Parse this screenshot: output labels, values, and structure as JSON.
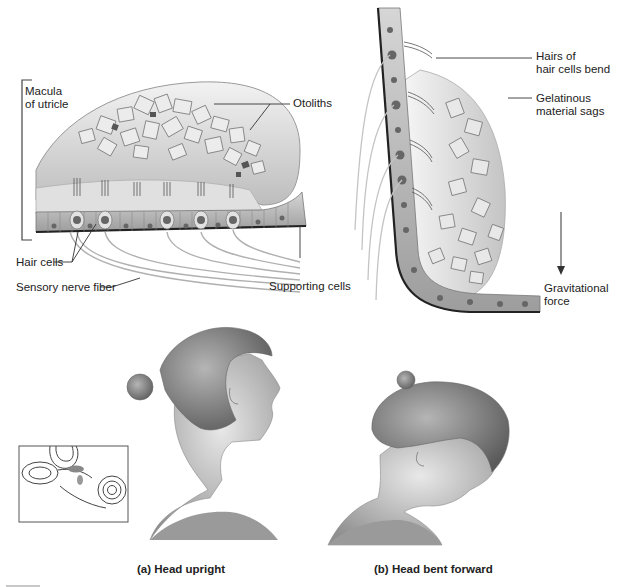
{
  "figure": {
    "panel_macula": {
      "labels": {
        "macula": "Macula\nof utricle",
        "macula_line1": "Macula",
        "macula_line2": "of utricle",
        "otoliths": "Otoliths",
        "hair_cells": "Hair cells",
        "sensory_nerve_fiber": "Sensory nerve fiber",
        "supporting_cells": "Supporting cells"
      }
    },
    "panel_bent": {
      "labels": {
        "hairs_bend_line1": "Hairs of",
        "hairs_bend_line2": "hair cells bend",
        "gelatinous_line1": "Gelatinous",
        "gelatinous_line2": "material sags",
        "gravity_line1": "Gravitational",
        "gravity_line2": "force"
      }
    },
    "captions": {
      "a": "(a) Head upright",
      "b": "(b) Head bent forward"
    },
    "colors": {
      "background": "#ffffff",
      "text": "#222222",
      "leader_line": "#333333",
      "tissue_light": "#d9d9d9",
      "tissue_mid": "#a8a8a8",
      "tissue_dark": "#555555",
      "nucleus": "#6e6e6e",
      "otolith_fill": "#e6e6e6",
      "skin": "#cfcfcf",
      "hair": "#8a8a8a"
    }
  }
}
